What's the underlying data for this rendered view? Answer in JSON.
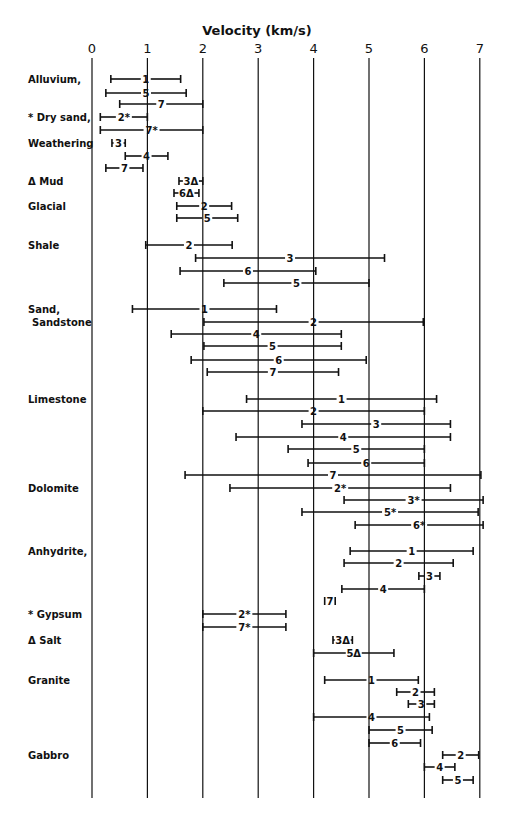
{
  "chart_data": {
    "type": "range-bar",
    "title": "",
    "xlabel": "Velocity (km/s)",
    "ylabel": "",
    "xlim": [
      0,
      7
    ],
    "xticks": [
      0,
      1,
      2,
      3,
      4,
      5,
      6,
      7
    ],
    "grid": "vertical lines at each integer velocity",
    "legend": "none (numeric labels on bars are source references; * and Δ marks annotate specific rock groups)",
    "groups": [
      {
        "rock": "Alluvium,",
        "bars": [
          {
            "label": "1",
            "min": 0.34,
            "max": 1.6
          },
          {
            "label": "5",
            "min": 0.25,
            "max": 1.7
          },
          {
            "label": "7",
            "min": 0.5,
            "max": 2.0
          }
        ]
      },
      {
        "rock": "* Dry sand,",
        "bars": [
          {
            "label": "2*",
            "min": 0.15,
            "max": 1.0
          },
          {
            "label": "7*",
            "min": 0.15,
            "max": 2.0
          }
        ]
      },
      {
        "rock": "Weathering",
        "bars": [
          {
            "label": "3",
            "min": 0.36,
            "max": 0.6
          },
          {
            "label": "4",
            "min": 0.6,
            "max": 1.37
          },
          {
            "label": "7",
            "min": 0.25,
            "max": 0.92
          }
        ]
      },
      {
        "rock": "Δ Mud",
        "bars": [
          {
            "label": "3Δ",
            "min": 1.57,
            "max": 2.0
          },
          {
            "label": "6Δ",
            "min": 1.48,
            "max": 1.93
          }
        ]
      },
      {
        "rock": "Glacial",
        "bars": [
          {
            "label": "2",
            "min": 1.53,
            "max": 2.52
          },
          {
            "label": "5",
            "min": 1.53,
            "max": 2.63
          }
        ]
      },
      {
        "rock": "Shale",
        "bars": [
          {
            "label": "2",
            "min": 0.97,
            "max": 2.53
          },
          {
            "label": "3",
            "min": 1.87,
            "max": 5.28
          },
          {
            "label": "6",
            "min": 1.59,
            "max": 4.04
          },
          {
            "label": "5",
            "min": 2.38,
            "max": 5.0
          }
        ]
      },
      {
        "rock": "Sand, Sandstone",
        "bars": [
          {
            "label": "1",
            "min": 0.73,
            "max": 3.33
          },
          {
            "label": "2",
            "min": 2.02,
            "max": 5.98
          },
          {
            "label": "4",
            "min": 1.43,
            "max": 4.5
          },
          {
            "label": "5",
            "min": 2.02,
            "max": 4.5
          },
          {
            "label": "6",
            "min": 1.79,
            "max": 4.95
          },
          {
            "label": "7",
            "min": 2.08,
            "max": 4.45
          }
        ]
      },
      {
        "rock": "Limestone",
        "bars": [
          {
            "label": "1",
            "min": 2.79,
            "max": 6.22
          },
          {
            "label": "2",
            "min": 2.0,
            "max": 6.0
          },
          {
            "label": "3",
            "min": 3.79,
            "max": 6.47
          },
          {
            "label": "4",
            "min": 2.6,
            "max": 6.47
          },
          {
            "label": "5",
            "min": 3.54,
            "max": 6.0
          },
          {
            "label": "6",
            "min": 3.9,
            "max": 6.0
          },
          {
            "label": "7",
            "min": 1.68,
            "max": 7.02
          }
        ]
      },
      {
        "rock": "Dolomite",
        "bars": [
          {
            "label": "2*",
            "min": 2.49,
            "max": 6.47
          },
          {
            "label": "3*",
            "min": 4.55,
            "max": 7.06
          },
          {
            "label": "5*",
            "min": 3.79,
            "max": 6.97
          },
          {
            "label": "6*",
            "min": 4.75,
            "max": 7.06
          }
        ]
      },
      {
        "rock": "Anhydrite,",
        "bars": [
          {
            "label": "1",
            "min": 4.66,
            "max": 6.88
          },
          {
            "label": "2",
            "min": 4.55,
            "max": 6.52
          },
          {
            "label": "3",
            "min": 5.9,
            "max": 6.28
          },
          {
            "label": "4",
            "min": 4.51,
            "max": 6.0
          },
          {
            "label": "7",
            "min": 4.2,
            "max": 4.39
          }
        ]
      },
      {
        "rock": "* Gypsum",
        "bars": [
          {
            "label": "2*",
            "min": 2.0,
            "max": 3.5
          },
          {
            "label": "7*",
            "min": 2.0,
            "max": 3.5
          }
        ]
      },
      {
        "rock": "Δ Salt",
        "bars": [
          {
            "label": "3Δ",
            "min": 4.35,
            "max": 4.7
          },
          {
            "label": "5Δ",
            "min": 4.0,
            "max": 5.45
          }
        ]
      },
      {
        "rock": "Granite",
        "bars": [
          {
            "label": "1",
            "min": 4.2,
            "max": 5.89
          },
          {
            "label": "2",
            "min": 5.5,
            "max": 6.18
          },
          {
            "label": "3",
            "min": 5.71,
            "max": 6.18
          },
          {
            "label": "4",
            "min": 4.0,
            "max": 6.09
          },
          {
            "label": "5",
            "min": 5.0,
            "max": 6.14
          },
          {
            "label": "6",
            "min": 5.0,
            "max": 5.93
          }
        ]
      },
      {
        "rock": "Gabbro",
        "bars": [
          {
            "label": "2",
            "min": 6.33,
            "max": 6.98
          },
          {
            "label": "4",
            "min": 6.0,
            "max": 6.55
          },
          {
            "label": "5",
            "min": 6.33,
            "max": 6.88
          }
        ]
      }
    ]
  },
  "layout": {
    "rock_labels": [
      {
        "text": "Alluvium,",
        "y": 79
      },
      {
        "text": "* Dry sand,",
        "y": 117
      },
      {
        "text": "Weathering",
        "y": 143
      },
      {
        "text": "Δ Mud",
        "y": 181
      },
      {
        "text": "Glacial",
        "y": 206
      },
      {
        "text": "Shale",
        "y": 245
      },
      {
        "text": "Sand,",
        "y": 309
      },
      {
        "text": "Sandstone",
        "y": 322,
        "indent": 4
      },
      {
        "text": "Limestone",
        "y": 399
      },
      {
        "text": "Dolomite",
        "y": 488
      },
      {
        "text": "Anhydrite,",
        "y": 551
      },
      {
        "text": "* Gypsum",
        "y": 614
      },
      {
        "text": "Δ Salt",
        "y": 640
      },
      {
        "text": "Granite",
        "y": 680
      },
      {
        "text": "Gabbro",
        "y": 755
      }
    ],
    "bar_rows_y": [
      [
        79,
        93,
        104
      ],
      [
        117,
        130
      ],
      [
        143,
        156,
        168
      ],
      [
        181,
        193
      ],
      [
        206,
        218
      ],
      [
        245,
        258,
        271,
        283
      ],
      [
        309,
        322,
        334,
        346,
        360,
        372
      ],
      [
        399,
        411,
        424,
        437,
        449,
        463,
        475
      ],
      [
        488,
        500,
        512,
        525
      ],
      [
        551,
        563,
        576,
        589,
        601
      ],
      [
        614,
        627
      ],
      [
        640,
        653
      ],
      [
        680,
        692,
        704,
        717,
        730,
        743
      ],
      [
        755,
        767,
        780
      ]
    ]
  }
}
